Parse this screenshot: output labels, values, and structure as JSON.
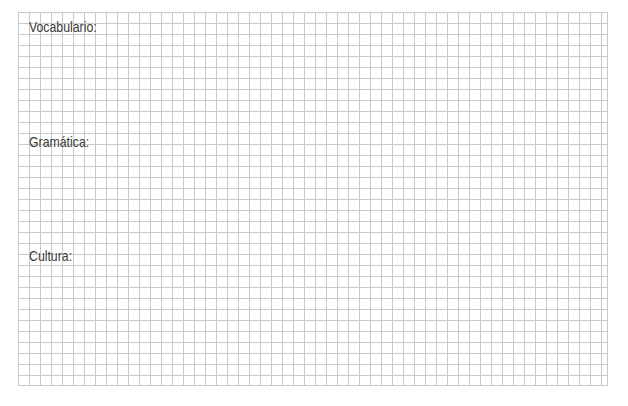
{
  "worksheet": {
    "sections": [
      {
        "label": "Vocabulario:"
      },
      {
        "label": "Gramática:"
      },
      {
        "label": "Cultura:"
      }
    ],
    "grid": {
      "line_color": "#c9c9c9",
      "cell_size_px": 11
    },
    "text_color": "#3a3a3a"
  }
}
